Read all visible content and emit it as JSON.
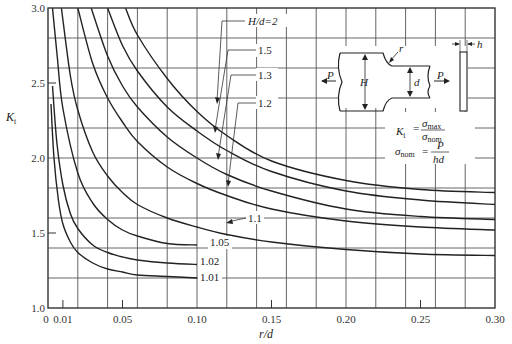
{
  "chart_data": {
    "type": "line",
    "title": "",
    "xlabel": "r/d",
    "ylabel": "K_t",
    "xlim": [
      0,
      0.3
    ],
    "ylim": [
      1.0,
      3.0
    ],
    "grid": true,
    "x_ticks": [
      "0",
      "0.01",
      "0.05",
      "0.10",
      "0.15",
      "0.20",
      "0.25",
      "0.30"
    ],
    "x_tick_values": [
      0,
      0.01,
      0.05,
      0.1,
      0.15,
      0.2,
      0.25,
      0.3
    ],
    "y_ticks": [
      "1.0",
      "1.5",
      "2.0",
      "2.5",
      "3.0"
    ],
    "y_tick_values": [
      1.0,
      1.5,
      2.0,
      2.5,
      3.0
    ],
    "legend_position": "inline labels with leader lines",
    "series": [
      {
        "name": "H/d=2",
        "label": "H/d=2",
        "x": [
          0.052,
          0.06,
          0.08,
          0.1,
          0.12,
          0.15,
          0.2,
          0.25,
          0.3
        ],
        "y": [
          3.0,
          2.82,
          2.53,
          2.31,
          2.15,
          1.98,
          1.85,
          1.79,
          1.77
        ]
      },
      {
        "name": "H/d=1.5",
        "label": "1.5",
        "x": [
          0.04,
          0.05,
          0.06,
          0.08,
          0.1,
          0.12,
          0.15,
          0.2,
          0.25,
          0.3
        ],
        "y": [
          3.0,
          2.75,
          2.58,
          2.34,
          2.18,
          2.05,
          1.91,
          1.78,
          1.72,
          1.69
        ]
      },
      {
        "name": "H/d=1.3",
        "label": "1.3",
        "x": [
          0.029,
          0.04,
          0.05,
          0.06,
          0.08,
          0.1,
          0.12,
          0.15,
          0.2,
          0.25,
          0.3
        ],
        "y": [
          3.0,
          2.68,
          2.48,
          2.34,
          2.14,
          2.0,
          1.89,
          1.78,
          1.66,
          1.61,
          1.59
        ]
      },
      {
        "name": "H/d=1.2",
        "label": "1.2",
        "x": [
          0.02,
          0.03,
          0.04,
          0.05,
          0.06,
          0.08,
          0.1,
          0.12,
          0.15,
          0.2,
          0.25,
          0.3
        ],
        "y": [
          3.0,
          2.63,
          2.4,
          2.24,
          2.11,
          1.94,
          1.83,
          1.75,
          1.66,
          1.58,
          1.54,
          1.52
        ]
      },
      {
        "name": "H/d=1.1",
        "label": "1.1",
        "x": [
          0.009,
          0.015,
          0.02,
          0.03,
          0.04,
          0.05,
          0.06,
          0.08,
          0.1,
          0.12,
          0.15,
          0.2,
          0.25,
          0.3
        ],
        "y": [
          3.0,
          2.55,
          2.32,
          2.04,
          1.88,
          1.77,
          1.69,
          1.6,
          1.54,
          1.49,
          1.44,
          1.39,
          1.36,
          1.35
        ]
      },
      {
        "name": "H/d=1.05",
        "label": "1.05",
        "x": [
          0.003,
          0.006,
          0.01,
          0.02,
          0.03,
          0.04,
          0.05,
          0.06,
          0.08,
          0.1
        ],
        "y": [
          3.0,
          2.7,
          2.33,
          1.9,
          1.7,
          1.59,
          1.52,
          1.48,
          1.43,
          1.42
        ]
      },
      {
        "name": "H/d=1.02",
        "label": "1.02",
        "x": [
          0.003,
          0.006,
          0.01,
          0.015,
          0.02,
          0.03,
          0.04,
          0.05,
          0.06,
          0.08,
          0.1
        ],
        "y": [
          2.48,
          2.1,
          1.82,
          1.63,
          1.53,
          1.42,
          1.37,
          1.34,
          1.32,
          1.3,
          1.29
        ]
      },
      {
        "name": "H/d=1.01",
        "label": "1.01",
        "x": [
          0.002,
          0.004,
          0.007,
          0.01,
          0.015,
          0.02,
          0.03,
          0.04,
          0.05,
          0.06,
          0.08,
          0.1
        ],
        "y": [
          2.36,
          2.0,
          1.72,
          1.56,
          1.44,
          1.37,
          1.3,
          1.26,
          1.24,
          1.22,
          1.21,
          1.2
        ]
      }
    ],
    "annotations": [
      "K_t = σ_max / σ_nom",
      "σ_nom = P / hd",
      "Stepped flat bar diagram with fillet radius r, widths H and d, thickness h, axial load P"
    ]
  },
  "axes": {
    "x_title": "r/d",
    "y_title_main": "K",
    "y_title_sub": "t"
  },
  "inset": {
    "labels": {
      "P_left": "P",
      "P_right": "P",
      "H": "H",
      "d": "d",
      "r": "r",
      "h": "h"
    },
    "formula1": {
      "lhs": "K",
      "lhs_sub": "t",
      "eq": "=",
      "num": "σ",
      "num_sub": "max",
      "den": "σ",
      "den_sub": "nom"
    },
    "formula2": {
      "lhs": "σ",
      "lhs_sub": "nom",
      "eq": "=",
      "num": "P",
      "den": "hd"
    }
  }
}
